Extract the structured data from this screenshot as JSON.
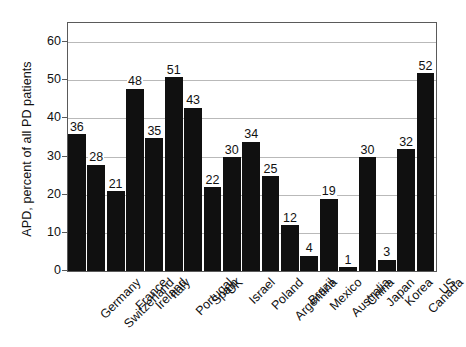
{
  "chart_data": {
    "type": "bar",
    "title": "",
    "subtitle": "",
    "xlabel": "",
    "ylabel": "APD, percent of all PD patients",
    "ylim": [
      0,
      65
    ],
    "yticks": [
      0,
      10,
      20,
      30,
      40,
      50,
      60
    ],
    "grid": true,
    "legend": "none",
    "bar_color": "#101010",
    "categories": [
      "Germany",
      "Switzerland",
      "France",
      "Ireland",
      "Italy",
      "Portugal",
      "Spain",
      "UK",
      "Israel",
      "Poland",
      "Argentina",
      "Brazil",
      "Mexico",
      "Australia",
      "China",
      "Japan",
      "Korea",
      "Canada",
      "US"
    ],
    "values": [
      36,
      28,
      21,
      48,
      35,
      51,
      43,
      22,
      30,
      34,
      25,
      12,
      4,
      19,
      1,
      30,
      3,
      32,
      52
    ],
    "data_labels": [
      "36",
      "28",
      "21",
      "48",
      "35",
      "51",
      "43",
      "22",
      "30",
      "34",
      "25",
      "12",
      "4",
      "19",
      "1",
      "30",
      "3",
      "32",
      "52"
    ]
  }
}
